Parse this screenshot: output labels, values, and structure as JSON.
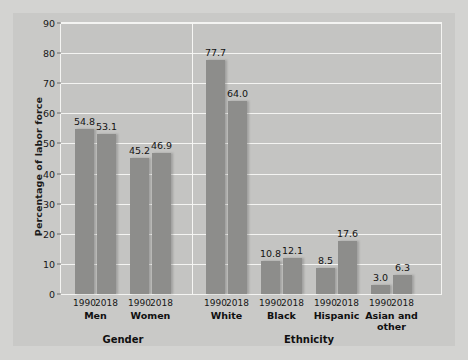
{
  "chart_data": {
    "type": "bar",
    "title": "",
    "xlabel": "",
    "ylabel": "Percentage of labor force",
    "ylim": [
      0,
      90
    ],
    "yticks": [
      0,
      10,
      20,
      30,
      40,
      50,
      60,
      70,
      80,
      90
    ],
    "ytick_labels": [
      "0",
      "10",
      "20",
      "30",
      "40",
      "50",
      "60",
      "70",
      "80",
      "90"
    ],
    "grid": true,
    "legend": "none",
    "group_axis_titles": [
      "Gender",
      "Ethnicity"
    ],
    "categories": [
      "Men",
      "Women",
      "White",
      "Black",
      "Hispanic",
      "Asian and\nother"
    ],
    "series": [
      {
        "name": "1990",
        "values": [
          54.8,
          45.2,
          77.7,
          10.8,
          8.5,
          3.0
        ]
      },
      {
        "name": "2018",
        "values": [
          53.1,
          46.9,
          64.0,
          12.1,
          17.6,
          6.3
        ]
      }
    ],
    "bars": [
      {
        "group": "Gender",
        "category": "Men",
        "year": "1990",
        "value": 54.8,
        "label": "54.8"
      },
      {
        "group": "Gender",
        "category": "Men",
        "year": "2018",
        "value": 53.1,
        "label": "53.1"
      },
      {
        "group": "Gender",
        "category": "Women",
        "year": "1990",
        "value": 45.2,
        "label": "45.2"
      },
      {
        "group": "Gender",
        "category": "Women",
        "year": "2018",
        "value": 46.9,
        "label": "46.9"
      },
      {
        "group": "Ethnicity",
        "category": "White",
        "year": "1990",
        "value": 77.7,
        "label": "77.7"
      },
      {
        "group": "Ethnicity",
        "category": "White",
        "year": "2018",
        "value": 64.0,
        "label": "64.0"
      },
      {
        "group": "Ethnicity",
        "category": "Black",
        "year": "1990",
        "value": 10.8,
        "label": "10.8"
      },
      {
        "group": "Ethnicity",
        "category": "Black",
        "year": "2018",
        "value": 12.1,
        "label": "12.1"
      },
      {
        "group": "Ethnicity",
        "category": "Hispanic",
        "year": "1990",
        "value": 8.5,
        "label": "8.5"
      },
      {
        "group": "Ethnicity",
        "category": "Hispanic",
        "year": "2018",
        "value": 17.6,
        "label": "17.6"
      },
      {
        "group": "Ethnicity",
        "category": "Asian and other",
        "year": "1990",
        "value": 3.0,
        "label": "3.0"
      },
      {
        "group": "Ethnicity",
        "category": "Asian and other",
        "year": "2018",
        "value": 6.3,
        "label": "6.3"
      }
    ],
    "colors": {
      "bar": "#8d8d8b",
      "plot_background": "#c4c4c2",
      "panel_background": "#c9c9c7",
      "page_background": "#d3d3d1",
      "gridline": "#f4f4f2",
      "text": "#131313"
    }
  },
  "axis": {
    "y_title": "Percentage of labor force"
  },
  "groups": [
    {
      "title": "Gender"
    },
    {
      "title": "Ethnicity"
    }
  ],
  "categories": [
    {
      "label": "Men"
    },
    {
      "label": "Women"
    },
    {
      "label": "White"
    },
    {
      "label": "Black"
    },
    {
      "label": "Hispanic"
    },
    {
      "label": "Asian and\nother"
    }
  ]
}
